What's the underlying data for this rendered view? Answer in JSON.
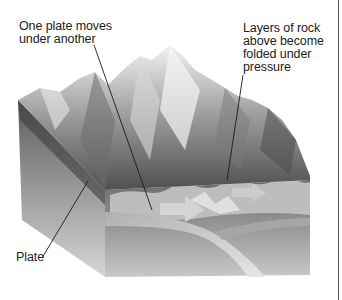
{
  "diagram": {
    "labels": {
      "subduction": "One plate moves\nunder another",
      "folding": "Layers of rock\nabove become\nfolded under\npressure",
      "plate": "Plate"
    },
    "colors": {
      "text": "#222222",
      "leader_line": "#1a1a1a",
      "mountain_light": "#e8e8e8",
      "mountain_dark": "#5a5a5a",
      "block_front": "#8c8c8c",
      "block_side": "#9a9a9a",
      "plate_band": "#b8b8b8",
      "folded_layers": "#c4c4c4",
      "arrow": "#d2d2d2"
    }
  }
}
